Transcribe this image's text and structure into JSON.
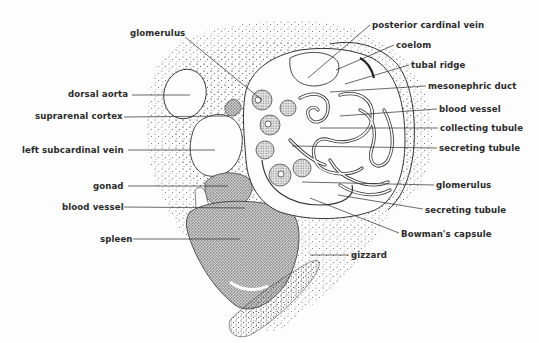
{
  "diagram": {
    "labels_left": [
      {
        "id": "glomerulus-top",
        "text": "glomerulus",
        "x": 130,
        "y": 33
      },
      {
        "id": "dorsal-aorta",
        "text": "dorsal aorta",
        "x": 68,
        "y": 89
      },
      {
        "id": "suprarenal-cortex",
        "text": "suprarenal cortex",
        "x": 35,
        "y": 111
      },
      {
        "id": "left-subcardinal-vein",
        "text": "left subcardinal vein",
        "x": 22,
        "y": 145
      },
      {
        "id": "gonad",
        "text": "gonad",
        "x": 93,
        "y": 181
      },
      {
        "id": "blood-vessel-left",
        "text": "blood vessel",
        "x": 62,
        "y": 202
      },
      {
        "id": "spleen",
        "text": "spleen",
        "x": 100,
        "y": 234
      }
    ],
    "labels_right": [
      {
        "id": "posterior-cardinal-vein",
        "text": "posterior cardinal vein",
        "x": 372,
        "y": 20
      },
      {
        "id": "coelom",
        "text": "coelom",
        "x": 396,
        "y": 40
      },
      {
        "id": "tubal-ridge",
        "text": "tubal ridge",
        "x": 411,
        "y": 60
      },
      {
        "id": "mesonephric-duct",
        "text": "mesonephric duct",
        "x": 428,
        "y": 81
      },
      {
        "id": "blood-vessel-right",
        "text": "blood vessel",
        "x": 439,
        "y": 104
      },
      {
        "id": "collecting-tubule",
        "text": "collecting tubule",
        "x": 440,
        "y": 123
      },
      {
        "id": "secreting-tubule-top",
        "text": "secreting tubule",
        "x": 439,
        "y": 143
      },
      {
        "id": "glomerulus-right",
        "text": "glomerulus",
        "x": 436,
        "y": 180
      },
      {
        "id": "secreting-tubule-bottom",
        "text": "secreting tubule",
        "x": 425,
        "y": 205
      },
      {
        "id": "bowmans-capsule",
        "text": "Bowman's capsule",
        "x": 401,
        "y": 229
      },
      {
        "id": "gizzard",
        "text": "gizzard",
        "x": 351,
        "y": 250
      }
    ],
    "colors": {
      "ink": "#2a2a2a",
      "stipple": "#555555",
      "background": "#fdfdfd"
    }
  }
}
